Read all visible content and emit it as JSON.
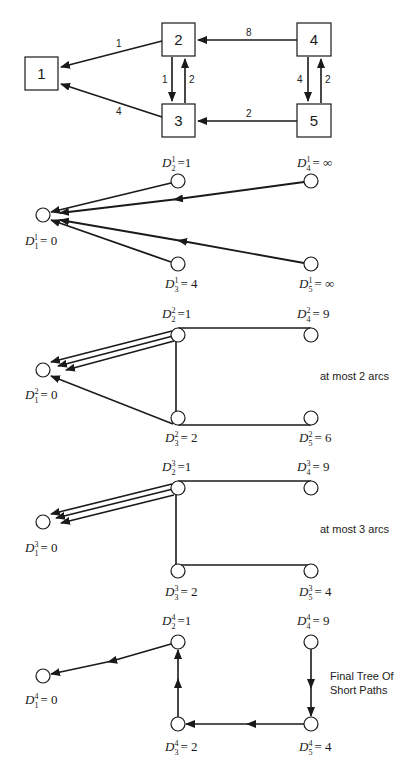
{
  "graph": {
    "nodes": [
      {
        "id": "1",
        "label": "1"
      },
      {
        "id": "2",
        "label": "2"
      },
      {
        "id": "3",
        "label": "3"
      },
      {
        "id": "4",
        "label": "4"
      },
      {
        "id": "5",
        "label": "5"
      }
    ],
    "edges": [
      {
        "from": "2",
        "to": "1",
        "weight": "1"
      },
      {
        "from": "3",
        "to": "1",
        "weight": "4"
      },
      {
        "from": "2",
        "to": "3",
        "weight": "1"
      },
      {
        "from": "3",
        "to": "2",
        "weight": "2"
      },
      {
        "from": "4",
        "to": "2",
        "weight": "8"
      },
      {
        "from": "5",
        "to": "3",
        "weight": "2"
      },
      {
        "from": "4",
        "to": "5",
        "weight": "4"
      },
      {
        "from": "5",
        "to": "4",
        "weight": "2"
      }
    ]
  },
  "stages": [
    {
      "iteration": "1",
      "labels": {
        "n1": {
          "sub": "1",
          "sup": "1",
          "value": "= 0"
        },
        "n2": {
          "sub": "2",
          "sup": "1",
          "value": "=1"
        },
        "n3": {
          "sub": "3",
          "sup": "1",
          "value": "= 4"
        },
        "n4": {
          "sub": "4",
          "sup": "1",
          "value": "= ∞"
        },
        "n5": {
          "sub": "5",
          "sup": "1",
          "value": "= ∞"
        }
      },
      "note": ""
    },
    {
      "iteration": "2",
      "labels": {
        "n1": {
          "sub": "1",
          "sup": "2",
          "value": "= 0"
        },
        "n2": {
          "sub": "2",
          "sup": "2",
          "value": "=1"
        },
        "n3": {
          "sub": "3",
          "sup": "2",
          "value": "= 2"
        },
        "n4": {
          "sub": "4",
          "sup": "2",
          "value": "= 9"
        },
        "n5": {
          "sub": "5",
          "sup": "2",
          "value": "= 6"
        }
      },
      "note": "at most 2 arcs"
    },
    {
      "iteration": "3",
      "labels": {
        "n1": {
          "sub": "1",
          "sup": "3",
          "value": "= 0"
        },
        "n2": {
          "sub": "2",
          "sup": "3",
          "value": "=1"
        },
        "n3": {
          "sub": "3",
          "sup": "3",
          "value": "= 2"
        },
        "n4": {
          "sub": "4",
          "sup": "3",
          "value": "= 9"
        },
        "n5": {
          "sub": "5",
          "sup": "3",
          "value": "= 4"
        }
      },
      "note": "at most 3 arcs"
    },
    {
      "iteration": "4",
      "labels": {
        "n1": {
          "sub": "1",
          "sup": "4",
          "value": "= 0"
        },
        "n2": {
          "sub": "2",
          "sup": "4",
          "value": "=1"
        },
        "n3": {
          "sub": "3",
          "sup": "4",
          "value": "= 2"
        },
        "n4": {
          "sub": "4",
          "sup": "4",
          "value": "= 9"
        },
        "n5": {
          "sub": "5",
          "sup": "4",
          "value": "= 4"
        }
      },
      "note_line1": "Final Tree Of",
      "note_line2": "Short Paths"
    }
  ],
  "colors": {
    "stroke": "#1a1a1a",
    "background": "#ffffff"
  }
}
